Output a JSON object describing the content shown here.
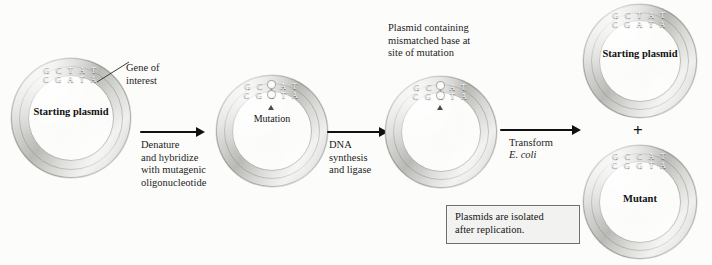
{
  "figure": {
    "background_color": "#fcfcfb",
    "ink_color": "#1a1a1a",
    "gene_band_color": "#82827f",
    "ring_color": "#d9d9d6"
  },
  "annotations": {
    "gene_of_interest": "Gene of\ninterest",
    "mutation": "Mutation",
    "mismatch_caption": "Plasmid containing\nmismatched base at\nsite of mutation",
    "plus_sign": "+"
  },
  "note_box": {
    "text": "Plasmids are isolated\nafter replication."
  },
  "steps": [
    {
      "id": "step-denature",
      "label": "Denature\nand hybridize\nwith mutagenic\noligonucleotide"
    },
    {
      "id": "step-synthesis",
      "label": "DNA\nsynthesis\nand ligase"
    },
    {
      "id": "step-transform",
      "label": "Transform",
      "organism": "E. coli"
    }
  ],
  "plasmids": [
    {
      "id": "plasmid-starting-1",
      "label": "Starting\nplasmid",
      "strand_top": "G C T A T",
      "strand_bottom": "C G A T A",
      "has_mutation_marker": false
    },
    {
      "id": "plasmid-hybridized",
      "label": "",
      "strand_top": "G C T A T",
      "strand_bottom": "C G G T A",
      "has_mutation_marker": true
    },
    {
      "id": "plasmid-mismatched",
      "label": "",
      "strand_top": "G C T A T",
      "strand_bottom": "C G G T A",
      "has_mutation_marker": true
    },
    {
      "id": "plasmid-starting-2",
      "label": "Starting\nplasmid",
      "strand_top": "G C T A T",
      "strand_bottom": "C G A T A",
      "has_mutation_marker": false
    },
    {
      "id": "plasmid-mutant",
      "label": "Mutant",
      "strand_top": "G C C A T",
      "strand_bottom": "C G G T A",
      "has_mutation_marker": false
    }
  ]
}
